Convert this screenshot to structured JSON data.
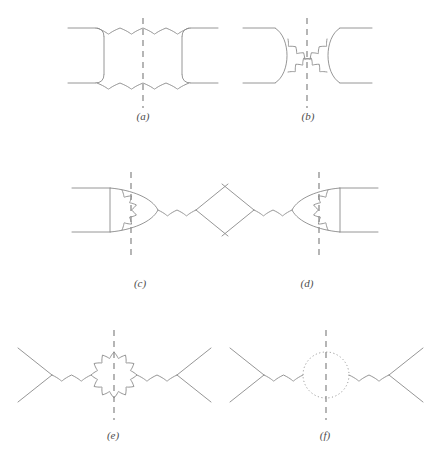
{
  "figure": {
    "title": "",
    "stroke_color": "#8a8a8a",
    "cut_color": "#8f8f8f",
    "background": "#ffffff",
    "width": 436,
    "height": 457
  },
  "panels": [
    {
      "id": "a",
      "label": "(a)",
      "label_x": 143,
      "label_y": 118,
      "description": "box diagram with two gluon exchanges, vertical unitarity cut",
      "cut": {
        "x": 143,
        "y1": 18,
        "y2": 108
      },
      "elements": [
        {
          "type": "fermion-line",
          "name": "incoming-upper-fermion",
          "x1": 68,
          "y1": 28,
          "x2": 100,
          "y2": 28
        },
        {
          "type": "fermion-line",
          "name": "incoming-lower-fermion",
          "x1": 68,
          "y1": 83,
          "x2": 100,
          "y2": 83
        },
        {
          "type": "fermion-line",
          "name": "outgoing-upper-fermion",
          "x1": 186,
          "y1": 28,
          "x2": 218,
          "y2": 28
        },
        {
          "type": "fermion-line",
          "name": "outgoing-lower-fermion",
          "x1": 186,
          "y1": 83,
          "x2": 218,
          "y2": 83
        },
        {
          "type": "fermion-line",
          "name": "left-vertical-fermion",
          "x1": 104,
          "y1": 31,
          "x2": 104,
          "y2": 80
        },
        {
          "type": "fermion-line",
          "name": "right-vertical-fermion",
          "x1": 182,
          "y1": 31,
          "x2": 182,
          "y2": 80
        },
        {
          "type": "gluon-line",
          "name": "upper-gluon",
          "x1": 104,
          "y1": 28,
          "x2": 182,
          "y2": 28,
          "coils": 4
        },
        {
          "type": "gluon-line",
          "name": "lower-gluon",
          "x1": 104,
          "y1": 83,
          "x2": 182,
          "y2": 83,
          "coils": 4
        }
      ]
    },
    {
      "id": "b",
      "label": "(b)",
      "label_x": 308,
      "label_y": 118,
      "description": "crossed-box diagram with two crossing gluon exchanges, vertical unitarity cut",
      "cut": {
        "x": 307,
        "y1": 18,
        "y2": 108
      },
      "elements": [
        {
          "type": "fermion-line",
          "name": "incoming-upper-fermion",
          "x1": 243,
          "y1": 28,
          "x2": 275,
          "y2": 28
        },
        {
          "type": "fermion-line",
          "name": "incoming-lower-fermion",
          "x1": 243,
          "y1": 83,
          "x2": 275,
          "y2": 83
        },
        {
          "type": "fermion-line",
          "name": "outgoing-upper-fermion",
          "x1": 340,
          "y1": 28,
          "x2": 372,
          "y2": 28
        },
        {
          "type": "fermion-line",
          "name": "outgoing-lower-fermion",
          "x1": 340,
          "y1": 83,
          "x2": 372,
          "y2": 83
        },
        {
          "type": "gluon-curve",
          "name": "crossing-gluon-upper",
          "coils": 5
        },
        {
          "type": "gluon-curve",
          "name": "crossing-gluon-lower",
          "coils": 5
        }
      ]
    },
    {
      "id": "c",
      "label": "(c)",
      "label_x": 140,
      "label_y": 285,
      "description": "vertex correction on the left fermion pair with gluon propagator to the right vertex, vertical unitarity cut",
      "cut": {
        "x": 131,
        "y1": 172,
        "y2": 258
      },
      "elements": [
        {
          "type": "fermion-line",
          "name": "incoming-upper-fermion",
          "x1": 72,
          "y1": 188,
          "x2": 110,
          "y2": 188
        },
        {
          "type": "fermion-line",
          "name": "incoming-lower-fermion",
          "x1": 72,
          "y1": 232,
          "x2": 110,
          "y2": 232
        },
        {
          "type": "fermion-line",
          "name": "left-vertical-fermion",
          "x1": 110,
          "y1": 188,
          "x2": 110,
          "y2": 232
        },
        {
          "type": "gluon-loop-arc",
          "name": "vertex-correction-gluon",
          "coils": 5
        },
        {
          "type": "gluon-line",
          "name": "s-channel-gluon",
          "x1": 158,
          "y1": 210,
          "x2": 196,
          "y2": 210,
          "coils": 2
        },
        {
          "type": "fermion-line",
          "name": "outgoing-upper-fermion",
          "x1": 196,
          "y1": 210,
          "x2": 228,
          "y2": 184
        },
        {
          "type": "fermion-line",
          "name": "outgoing-lower-fermion",
          "x1": 196,
          "y1": 210,
          "x2": 228,
          "y2": 236
        }
      ]
    },
    {
      "id": "d",
      "label": "(d)",
      "label_x": 307,
      "label_y": 285,
      "description": "mirror of panel c: vertex correction on the right fermion pair, vertical unitarity cut",
      "cut": {
        "x": 319,
        "y1": 172,
        "y2": 258
      },
      "elements": [
        {
          "type": "fermion-line",
          "name": "incoming-upper-fermion",
          "x1": 222,
          "y1": 184,
          "x2": 254,
          "y2": 210
        },
        {
          "type": "fermion-line",
          "name": "incoming-lower-fermion",
          "x1": 222,
          "y1": 236,
          "x2": 254,
          "y2": 210
        },
        {
          "type": "gluon-line",
          "name": "s-channel-gluon",
          "x1": 254,
          "y1": 210,
          "x2": 292,
          "y2": 210,
          "coils": 2
        },
        {
          "type": "gluon-loop-arc",
          "name": "vertex-correction-gluon",
          "coils": 5
        },
        {
          "type": "fermion-line",
          "name": "right-vertical-fermion",
          "x1": 340,
          "y1": 188,
          "x2": 340,
          "y2": 232
        },
        {
          "type": "fermion-line",
          "name": "outgoing-upper-fermion",
          "x1": 340,
          "y1": 188,
          "x2": 378,
          "y2": 188
        },
        {
          "type": "fermion-line",
          "name": "outgoing-lower-fermion",
          "x1": 340,
          "y1": 232,
          "x2": 378,
          "y2": 232
        }
      ]
    },
    {
      "id": "e",
      "label": "(e)",
      "label_x": 113,
      "label_y": 437,
      "description": "gluon self-energy with a gluon loop, vertical unitarity cut",
      "cut": {
        "x": 114,
        "y1": 330,
        "y2": 420
      },
      "elements": [
        {
          "type": "fermion-line",
          "name": "incoming-upper-fermion",
          "x1": 18,
          "y1": 348,
          "x2": 52,
          "y2": 375
        },
        {
          "type": "fermion-line",
          "name": "incoming-lower-fermion",
          "x1": 18,
          "y1": 402,
          "x2": 52,
          "y2": 375
        },
        {
          "type": "gluon-line",
          "name": "left-gluon-propagator",
          "x1": 52,
          "y1": 375,
          "x2": 92,
          "y2": 375,
          "coils": 2
        },
        {
          "type": "gluon-loop-circle",
          "name": "gluon-loop",
          "cx": 114,
          "cy": 375,
          "r": 23,
          "coils": 12
        },
        {
          "type": "gluon-line",
          "name": "right-gluon-propagator",
          "x1": 137,
          "y1": 375,
          "x2": 177,
          "y2": 375,
          "coils": 2
        },
        {
          "type": "fermion-line",
          "name": "outgoing-upper-fermion",
          "x1": 177,
          "y1": 375,
          "x2": 211,
          "y2": 348
        },
        {
          "type": "fermion-line",
          "name": "outgoing-lower-fermion",
          "x1": 177,
          "y1": 375,
          "x2": 211,
          "y2": 402
        }
      ]
    },
    {
      "id": "f",
      "label": "(f)",
      "label_x": 325,
      "label_y": 437,
      "description": "gluon self-energy with a ghost loop drawn as a dotted circle, vertical unitarity cut",
      "cut": {
        "x": 326,
        "y1": 330,
        "y2": 420
      },
      "elements": [
        {
          "type": "fermion-line",
          "name": "incoming-upper-fermion",
          "x1": 230,
          "y1": 348,
          "x2": 264,
          "y2": 375
        },
        {
          "type": "fermion-line",
          "name": "incoming-lower-fermion",
          "x1": 230,
          "y1": 402,
          "x2": 264,
          "y2": 375
        },
        {
          "type": "gluon-line",
          "name": "left-gluon-propagator",
          "x1": 264,
          "y1": 375,
          "x2": 304,
          "y2": 375,
          "coils": 2
        },
        {
          "type": "ghost-loop-circle",
          "name": "ghost-loop",
          "cx": 326,
          "cy": 375,
          "r": 23
        },
        {
          "type": "gluon-line",
          "name": "right-gluon-propagator",
          "x1": 349,
          "y1": 375,
          "x2": 389,
          "y2": 375,
          "coils": 2
        },
        {
          "type": "fermion-line",
          "name": "outgoing-upper-fermion",
          "x1": 389,
          "y1": 375,
          "x2": 423,
          "y2": 348
        },
        {
          "type": "fermion-line",
          "name": "outgoing-lower-fermion",
          "x1": 389,
          "y1": 375,
          "x2": 423,
          "y2": 402
        }
      ]
    }
  ]
}
